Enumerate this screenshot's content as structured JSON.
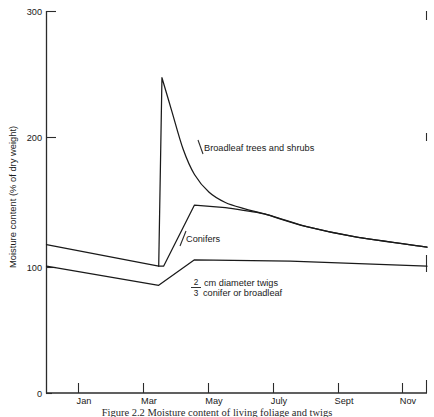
{
  "chart_data": {
    "type": "line",
    "title": "",
    "xlabel": "",
    "ylabel": "Moisture content (% of dry weight)",
    "ylim": [
      0,
      300
    ],
    "yticks": [
      0,
      100,
      200,
      300
    ],
    "ytick_labels": [
      "0",
      "100",
      "200",
      "300"
    ],
    "xtick_labels": [
      "Jan",
      "Mar",
      "May",
      "July",
      "Sept",
      "Nov"
    ],
    "xtick_months": [
      1,
      3,
      5,
      7,
      9,
      11
    ],
    "xlim_months": [
      0.5,
      12.2
    ],
    "grid": false,
    "legend": "inline-annotations",
    "series": [
      {
        "name": "Broadleaf trees and shrubs",
        "label_text": "Broadleaf trees and shrubs",
        "points": [
          {
            "month": 3.95,
            "value": 100
          },
          {
            "month": 4.05,
            "value": 248
          },
          {
            "month": 4.35,
            "value": 222
          },
          {
            "month": 4.7,
            "value": 192
          },
          {
            "month": 5.05,
            "value": 172
          },
          {
            "month": 5.5,
            "value": 158
          },
          {
            "month": 6.0,
            "value": 150
          },
          {
            "month": 6.6,
            "value": 145
          },
          {
            "month": 7.2,
            "value": 141
          },
          {
            "month": 8.5,
            "value": 131
          },
          {
            "month": 10.0,
            "value": 123
          },
          {
            "month": 12.2,
            "value": 115
          }
        ]
      },
      {
        "name": "Conifers",
        "label_text": "Conifers",
        "points": [
          {
            "month": 0.5,
            "value": 117
          },
          {
            "month": 3.95,
            "value": 100
          },
          {
            "month": 4.1,
            "value": 100
          },
          {
            "month": 5.05,
            "value": 148
          },
          {
            "month": 6.0,
            "value": 146
          },
          {
            "month": 7.2,
            "value": 141
          },
          {
            "month": 8.5,
            "value": 131
          },
          {
            "month": 10.0,
            "value": 123
          },
          {
            "month": 12.2,
            "value": 115
          }
        ]
      },
      {
        "name": "2/3 cm diameter twigs, conifer or broadleaf",
        "label_text": "cm diameter twigs conifer or broadleaf",
        "points": [
          {
            "month": 0.5,
            "value": 100
          },
          {
            "month": 3.95,
            "value": 85
          },
          {
            "month": 5.05,
            "value": 105
          },
          {
            "month": 8.0,
            "value": 104
          },
          {
            "month": 12.2,
            "value": 100
          }
        ]
      }
    ],
    "annotations": [
      {
        "name": "broadleaf-label",
        "text": "Broadleaf trees and shrubs",
        "x_px": 203,
        "y_px": 150
      },
      {
        "name": "conifers-label",
        "text": "Conifers",
        "x_px": 186,
        "y_px": 241
      },
      {
        "name": "twigs-label",
        "fraction_numerator": "2",
        "fraction_denominator": "3",
        "line1": "cm diameter twigs",
        "line2": "conifer or broadleaf",
        "x_px": 206,
        "y_px": 287
      }
    ],
    "colors": {
      "curve": "#1a1a1a",
      "axis": "#2b2b2b",
      "background": "#ffffff",
      "text": "#1a1a1a"
    }
  },
  "figure": {
    "caption": "Figure 2.2 Moisture content of living foliage and twigs"
  }
}
